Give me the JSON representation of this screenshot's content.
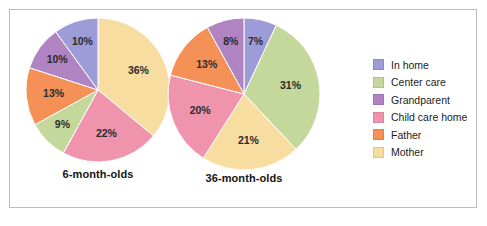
{
  "figure": {
    "background_color": "#ffffff",
    "border_color": "#b9bcc0"
  },
  "legend": {
    "position": "right",
    "items": [
      {
        "label": "In home",
        "color": "#9d9bd8"
      },
      {
        "label": "Center care",
        "color": "#c3d89a"
      },
      {
        "label": "Grandparent",
        "color": "#b083c2"
      },
      {
        "label": "Child care home",
        "color": "#f094ae"
      },
      {
        "label": "Father",
        "color": "#f59156"
      },
      {
        "label": "Mother",
        "color": "#f8dda1"
      }
    ]
  },
  "chart_data": [
    {
      "type": "pie",
      "title": "6-month-olds",
      "start_angle": 0,
      "direction": "clockwise",
      "categories": [
        "Mother",
        "Child care home",
        "Center care",
        "Father",
        "Grandparent",
        "In home"
      ],
      "values": [
        36,
        22,
        9,
        13,
        10,
        10
      ],
      "labels": [
        "36%",
        "22%",
        "9%",
        "13%",
        "10%",
        "10%"
      ],
      "colors": [
        "#f8dda1",
        "#f094ae",
        "#c3d89a",
        "#f59156",
        "#b083c2",
        "#9d9bd8"
      ]
    },
    {
      "type": "pie",
      "title": "36-month-olds",
      "start_angle": 0,
      "direction": "clockwise",
      "categories": [
        "In home",
        "Center care",
        "Mother",
        "Child care home",
        "Father",
        "Grandparent"
      ],
      "values": [
        7,
        31,
        21,
        20,
        13,
        8
      ],
      "labels": [
        "7%",
        "31%",
        "21%",
        "20%",
        "13%",
        "8%"
      ],
      "colors": [
        "#9d9bd8",
        "#c3d89a",
        "#f8dda1",
        "#f094ae",
        "#f59156",
        "#b083c2"
      ]
    }
  ]
}
